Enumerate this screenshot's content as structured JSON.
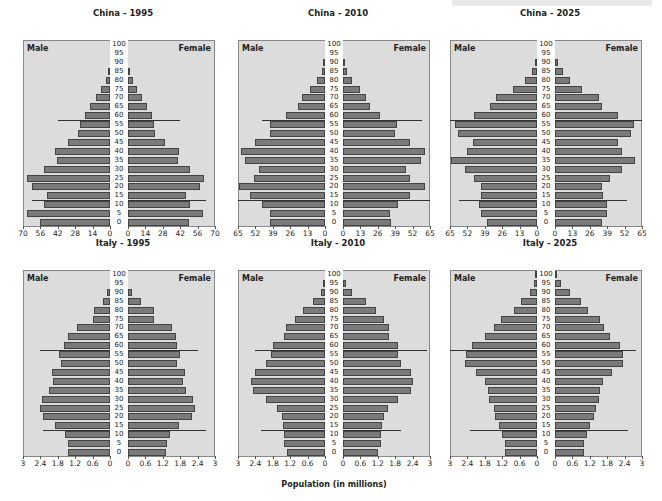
{
  "caption": "Population (in millions)",
  "chart_data": [
    {
      "type": "bar",
      "orientation": "horizontal-population-pyramid",
      "title": "China - 1995",
      "left_label": "Male",
      "right_label": "Female",
      "age_groups": [
        0,
        5,
        10,
        15,
        20,
        25,
        30,
        35,
        40,
        45,
        50,
        55,
        60,
        65,
        70,
        75,
        80,
        85,
        90,
        95,
        100
      ],
      "xlim": [
        0,
        70
      ],
      "ticks": [
        70,
        56,
        42,
        28,
        14,
        0
      ],
      "male": [
        56,
        67,
        53,
        51,
        63,
        67,
        53,
        43,
        44,
        34,
        26,
        24,
        20,
        16,
        11,
        7,
        3,
        1.5,
        0,
        0,
        0
      ],
      "female": [
        49,
        60,
        50,
        47,
        58,
        61,
        50,
        40,
        41,
        30,
        22,
        21,
        19,
        15,
        11,
        7,
        4,
        1.5,
        0,
        0,
        0
      ],
      "ref_lines": {
        "upper_age": 57.5,
        "upper_male": 42,
        "upper_female": 42,
        "lower_age": 12.5,
        "lower_male": 63,
        "lower_female": 63
      },
      "xlabel": "Population (in millions)"
    },
    {
      "type": "bar",
      "orientation": "horizontal-population-pyramid",
      "title": "China - 2010",
      "left_label": "Male",
      "right_label": "Female",
      "age_groups": [
        0,
        5,
        10,
        15,
        20,
        25,
        30,
        35,
        40,
        45,
        50,
        55,
        60,
        65,
        70,
        75,
        80,
        85,
        90,
        95,
        100
      ],
      "xlim": [
        0,
        65
      ],
      "ticks": [
        65,
        52,
        39,
        26,
        13,
        0
      ],
      "male": [
        41,
        41,
        47,
        56,
        64,
        53,
        49,
        60,
        63,
        52,
        41,
        41,
        29,
        20,
        17,
        11,
        6,
        2,
        0.5,
        0,
        0
      ],
      "female": [
        36,
        35,
        41,
        50,
        61,
        50,
        47,
        58,
        61,
        50,
        39,
        40,
        28,
        20,
        17,
        13,
        7,
        3,
        0.5,
        0,
        0
      ],
      "ref_lines": {
        "upper_age": 57.5,
        "upper_male": 47,
        "upper_female": 59,
        "lower_age": 12.5,
        "lower_male": 65,
        "lower_female": 65
      },
      "xlabel": "Population (in millions)"
    },
    {
      "type": "bar",
      "orientation": "horizontal-population-pyramid",
      "title": "China - 2025",
      "left_label": "Male",
      "right_label": "Female",
      "age_groups": [
        0,
        5,
        10,
        15,
        20,
        25,
        30,
        35,
        40,
        45,
        50,
        55,
        60,
        65,
        70,
        75,
        80,
        85,
        90,
        95,
        100
      ],
      "xlim": [
        0,
        65
      ],
      "ticks": [
        65,
        52,
        39,
        26,
        13,
        0
      ],
      "male": [
        37,
        42,
        43,
        42,
        42,
        47,
        54,
        64,
        52,
        48,
        59,
        61,
        47,
        35,
        31,
        18,
        9,
        4,
        1,
        0,
        0
      ],
      "female": [
        35,
        39,
        39,
        36,
        35,
        41,
        50,
        60,
        50,
        47,
        57,
        59,
        47,
        35,
        33,
        20,
        11,
        6,
        2,
        0,
        0
      ],
      "ref_lines": {
        "upper_age": 57.5,
        "upper_male": 65,
        "upper_female": 65,
        "lower_age": 12.5,
        "lower_male": 58,
        "lower_female": 54
      },
      "xlabel": "Population (in millions)"
    },
    {
      "type": "bar",
      "orientation": "horizontal-population-pyramid",
      "title": "Italy - 1995",
      "left_label": "Male",
      "right_label": "Female",
      "age_groups": [
        0,
        5,
        10,
        15,
        20,
        25,
        30,
        35,
        40,
        45,
        50,
        55,
        60,
        65,
        70,
        75,
        80,
        85,
        90,
        95,
        100
      ],
      "xlim": [
        0,
        3
      ],
      "ticks": [
        3,
        2.4,
        1.8,
        1.2,
        0.6,
        0
      ],
      "male": [
        1.45,
        1.45,
        1.55,
        1.9,
        2.3,
        2.4,
        2.35,
        2.1,
        1.95,
        2.0,
        1.7,
        1.75,
        1.6,
        1.45,
        1.15,
        0.6,
        0.55,
        0.25,
        0.1,
        0,
        0
      ],
      "female": [
        1.3,
        1.35,
        1.45,
        1.75,
        2.2,
        2.3,
        2.25,
        2.0,
        1.9,
        1.95,
        1.7,
        1.8,
        1.7,
        1.65,
        1.5,
        0.9,
        0.9,
        0.45,
        0.15,
        0,
        0
      ],
      "ref_lines": {
        "upper_age": 57.5,
        "upper_male": 2.4,
        "upper_female": 2.4,
        "lower_age": 12.5,
        "lower_male": 2.3,
        "lower_female": 2.7
      },
      "xlabel": "Population (in millions)"
    },
    {
      "type": "bar",
      "orientation": "horizontal-population-pyramid",
      "title": "Italy - 2010",
      "left_label": "Male",
      "right_label": "Female",
      "age_groups": [
        0,
        5,
        10,
        15,
        20,
        25,
        30,
        35,
        40,
        45,
        50,
        55,
        60,
        65,
        70,
        75,
        80,
        85,
        90,
        95,
        100
      ],
      "xlim": [
        0,
        3
      ],
      "ticks": [
        3,
        2.4,
        1.8,
        1.2,
        0.6,
        0
      ],
      "male": [
        1.3,
        1.4,
        1.4,
        1.45,
        1.5,
        1.65,
        2.05,
        2.5,
        2.55,
        2.4,
        2.05,
        1.85,
        1.8,
        1.4,
        1.35,
        1.05,
        0.75,
        0.4,
        0.15,
        0.07,
        0
      ],
      "female": [
        1.2,
        1.3,
        1.3,
        1.35,
        1.4,
        1.55,
        1.9,
        2.35,
        2.4,
        2.35,
        2.0,
        1.9,
        1.9,
        1.6,
        1.6,
        1.4,
        1.15,
        0.8,
        0.3,
        0.1,
        0
      ],
      "ref_lines": {
        "upper_age": 57.5,
        "upper_male": 2.4,
        "upper_female": 2.9,
        "lower_age": 12.5,
        "lower_male": 2.2,
        "lower_female": 2.0
      },
      "xlabel": "Population (in millions)"
    },
    {
      "type": "bar",
      "orientation": "horizontal-population-pyramid",
      "title": "Italy - 2025",
      "left_label": "Male",
      "right_label": "Female",
      "age_groups": [
        0,
        5,
        10,
        15,
        20,
        25,
        30,
        35,
        40,
        45,
        50,
        55,
        60,
        65,
        70,
        75,
        80,
        85,
        90,
        95,
        100
      ],
      "xlim": [
        0,
        3
      ],
      "ticks": [
        3,
        2.4,
        1.8,
        1.2,
        0.6,
        0
      ],
      "male": [
        1.1,
        1.1,
        1.2,
        1.3,
        1.45,
        1.5,
        1.65,
        1.7,
        1.8,
        2.1,
        2.5,
        2.45,
        2.25,
        1.8,
        1.5,
        1.25,
        0.8,
        0.55,
        0.25,
        0.1,
        0.05
      ],
      "female": [
        1.0,
        1.0,
        1.1,
        1.2,
        1.35,
        1.4,
        1.5,
        1.55,
        1.65,
        1.95,
        2.35,
        2.35,
        2.25,
        1.9,
        1.7,
        1.55,
        1.15,
        0.9,
        0.5,
        0.2,
        0.05
      ],
      "ref_lines": {
        "upper_age": 57.5,
        "upper_male": 3.0,
        "upper_female": 2.8,
        "lower_age": 12.5,
        "lower_male": 2.3,
        "lower_female": 2.5
      },
      "xlabel": "Population (in millions)"
    }
  ],
  "positions": [
    {
      "left": 23,
      "top": 26
    },
    {
      "left": 238,
      "top": 26
    },
    {
      "left": 450,
      "top": 26
    },
    {
      "left": 23,
      "top": 256
    },
    {
      "left": 238,
      "top": 256
    },
    {
      "left": 450,
      "top": 256
    }
  ],
  "colors": {
    "panel_bg": "#dcdcdc",
    "bar_fill": "#7a7a7a",
    "bar_border": "#444444",
    "ref_line": "#333333"
  }
}
